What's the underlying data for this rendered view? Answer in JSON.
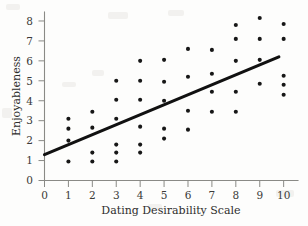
{
  "chart_data": {
    "type": "scatter",
    "title": "",
    "xlabel": "Dating Desirability Scale",
    "ylabel": "Enjoyableness",
    "xlim": [
      0,
      10.6
    ],
    "ylim": [
      0,
      8.45
    ],
    "xticks": [
      0,
      1,
      2,
      3,
      4,
      5,
      6,
      7,
      8,
      9,
      10
    ],
    "xticklabels": [
      "0",
      "1",
      "2",
      "3",
      "4",
      "5",
      "6",
      "7",
      "8",
      "9",
      "10"
    ],
    "yticks": [
      0,
      1,
      2,
      3,
      4,
      5,
      6,
      7,
      8
    ],
    "yticklabels": [
      "0",
      "1",
      "2",
      "3",
      "4",
      "5",
      "6",
      "7",
      "8"
    ],
    "grid": false,
    "legend": null,
    "points": [
      {
        "x": 1,
        "y": 3.1
      },
      {
        "x": 1,
        "y": 2.6
      },
      {
        "x": 1,
        "y": 2.0
      },
      {
        "x": 1,
        "y": 0.95
      },
      {
        "x": 2,
        "y": 3.45
      },
      {
        "x": 2,
        "y": 2.65
      },
      {
        "x": 2,
        "y": 1.4
      },
      {
        "x": 2,
        "y": 0.95
      },
      {
        "x": 3,
        "y": 5.0
      },
      {
        "x": 3,
        "y": 4.05
      },
      {
        "x": 3,
        "y": 3.1
      },
      {
        "x": 3,
        "y": 1.8
      },
      {
        "x": 3,
        "y": 1.4
      },
      {
        "x": 3,
        "y": 0.95
      },
      {
        "x": 4,
        "y": 6.0
      },
      {
        "x": 4,
        "y": 5.0
      },
      {
        "x": 4,
        "y": 4.05
      },
      {
        "x": 4,
        "y": 2.7
      },
      {
        "x": 4,
        "y": 1.8
      },
      {
        "x": 4,
        "y": 1.4
      },
      {
        "x": 5,
        "y": 6.05
      },
      {
        "x": 5,
        "y": 4.95
      },
      {
        "x": 5,
        "y": 4.0
      },
      {
        "x": 5,
        "y": 2.6
      },
      {
        "x": 5,
        "y": 2.1
      },
      {
        "x": 6,
        "y": 6.6
      },
      {
        "x": 6,
        "y": 5.2
      },
      {
        "x": 6,
        "y": 3.5
      },
      {
        "x": 6,
        "y": 2.55
      },
      {
        "x": 7,
        "y": 6.55
      },
      {
        "x": 7,
        "y": 5.35
      },
      {
        "x": 7,
        "y": 4.45
      },
      {
        "x": 7,
        "y": 3.45
      },
      {
        "x": 8,
        "y": 7.8
      },
      {
        "x": 8,
        "y": 7.1
      },
      {
        "x": 8,
        "y": 6.0
      },
      {
        "x": 8,
        "y": 4.45
      },
      {
        "x": 8,
        "y": 3.45
      },
      {
        "x": 9,
        "y": 8.15
      },
      {
        "x": 9,
        "y": 7.1
      },
      {
        "x": 9,
        "y": 6.05
      },
      {
        "x": 9,
        "y": 4.85
      },
      {
        "x": 10,
        "y": 7.85
      },
      {
        "x": 10,
        "y": 7.1
      },
      {
        "x": 10,
        "y": 5.25
      },
      {
        "x": 10,
        "y": 4.8
      },
      {
        "x": 10,
        "y": 4.3
      }
    ],
    "trend_line": {
      "x_start": 0.0,
      "y_start": 1.3,
      "x_end": 9.8,
      "y_end": 6.2
    }
  }
}
